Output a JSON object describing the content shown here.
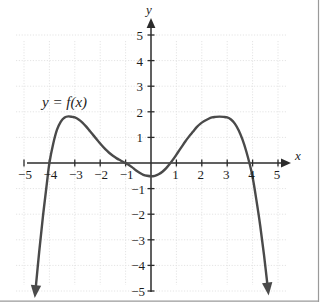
{
  "figure": {
    "background_color": "#ffffff",
    "curve_color": "#4a4a4a",
    "axis_color": "#2b2b2b",
    "grid_color": "#e2e2e2",
    "border_color": "#9a9a9a",
    "curve_label": "y = f(x)",
    "x_axis_name": "x",
    "y_axis_name": "y"
  },
  "axis_labels": {
    "x_negative": [
      "−5",
      "−4",
      "−3",
      "−2",
      "−1"
    ],
    "x_positive": [
      "1",
      "2",
      "3",
      "4",
      "5"
    ],
    "y_positive": [
      "1",
      "2",
      "3",
      "4",
      "5"
    ],
    "y_negative": [
      "−1",
      "−2",
      "−3",
      "−4",
      "−5"
    ]
  },
  "chart_data": {
    "type": "line",
    "title": "",
    "subtitle": "",
    "xlabel": "x",
    "ylabel": "y",
    "xlim": [
      -5,
      5
    ],
    "ylim": [
      -5,
      5
    ],
    "xticks": [
      -5,
      -4,
      -3,
      -2,
      -1,
      1,
      2,
      3,
      4,
      5
    ],
    "yticks": [
      -5,
      -4,
      -3,
      -2,
      -1,
      1,
      2,
      3,
      4,
      5
    ],
    "grid": true,
    "grid_style": "dotted",
    "legend": null,
    "annotations": [
      {
        "text": "y = f(x)",
        "x": -3.3,
        "y": 2.6,
        "style": "italic"
      }
    ],
    "series": [
      {
        "name": "y = f(x)",
        "color": "#4a4a4a",
        "line_width": 2.4,
        "arrow_start": "down",
        "arrow_end": "down",
        "x": [
          -4.55,
          -4.4,
          -4.25,
          -4.1,
          -4.0,
          -3.85,
          -3.7,
          -3.55,
          -3.4,
          -3.25,
          -3.1,
          -3.0,
          -2.85,
          -2.7,
          -2.55,
          -2.4,
          -2.25,
          -2.1,
          -1.95,
          -1.8,
          -1.65,
          -1.5,
          -1.35,
          -1.2,
          -1.05,
          -0.9,
          -0.75,
          -0.6,
          -0.45,
          -0.3,
          -0.15,
          0.0,
          0.15,
          0.3,
          0.45,
          0.6,
          0.75,
          0.9,
          1.05,
          1.2,
          1.35,
          1.5,
          1.65,
          1.8,
          1.95,
          2.1,
          2.25,
          2.4,
          2.55,
          2.7,
          2.85,
          3.0,
          3.15,
          3.3,
          3.45,
          3.6,
          3.75,
          3.9,
          4.0,
          4.15,
          4.3,
          4.45,
          4.6
        ],
        "y": [
          -5.0,
          -3.45,
          -2.05,
          -0.8,
          0.0,
          0.75,
          1.3,
          1.62,
          1.78,
          1.82,
          1.8,
          1.78,
          1.7,
          1.58,
          1.42,
          1.24,
          1.06,
          0.88,
          0.7,
          0.54,
          0.4,
          0.28,
          0.18,
          0.1,
          0.02,
          -0.06,
          -0.16,
          -0.28,
          -0.38,
          -0.46,
          -0.5,
          -0.52,
          -0.5,
          -0.44,
          -0.34,
          -0.2,
          -0.02,
          0.18,
          0.4,
          0.62,
          0.84,
          1.04,
          1.22,
          1.4,
          1.54,
          1.64,
          1.72,
          1.78,
          1.8,
          1.81,
          1.8,
          1.78,
          1.7,
          1.54,
          1.28,
          0.92,
          0.46,
          -0.1,
          -0.55,
          -1.45,
          -2.45,
          -3.6,
          -4.9
        ],
        "key_points": {
          "x_intercepts": [
            -4.0,
            -1.1,
            0.78,
            3.87
          ],
          "local_maxima": [
            {
              "x": -3.2,
              "y": 1.82
            },
            {
              "x": 2.8,
              "y": 1.81
            }
          ],
          "local_minima": [
            {
              "x": 0.0,
              "y": -0.52
            }
          ],
          "end_behavior": {
            "left": "-infinity",
            "right": "-infinity"
          }
        }
      }
    ]
  }
}
